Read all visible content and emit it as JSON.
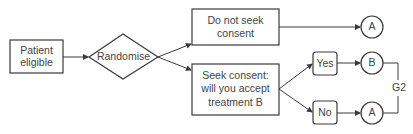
{
  "diagram": {
    "type": "flowchart",
    "nodes": {
      "patient": {
        "line1": "Patient",
        "line2": "eligible"
      },
      "randomise": {
        "label": "Randomise"
      },
      "no_consent": {
        "line1": "Do not seek",
        "line2": "consent"
      },
      "seek_consent": {
        "line1": "Seek consent:",
        "line2": "will you accept",
        "line3": "treatment B"
      },
      "yes": {
        "label": "Yes"
      },
      "no": {
        "label": "No"
      },
      "outcome_a_top": {
        "label": "A"
      },
      "outcome_b": {
        "label": "B"
      },
      "outcome_a_bottom": {
        "label": "A"
      },
      "group": {
        "label": "G2"
      }
    },
    "edges": [
      {
        "from": "patient",
        "to": "randomise"
      },
      {
        "from": "randomise",
        "to": "no_consent"
      },
      {
        "from": "randomise",
        "to": "seek_consent"
      },
      {
        "from": "no_consent",
        "to": "outcome_a_top"
      },
      {
        "from": "seek_consent",
        "to": "yes"
      },
      {
        "from": "seek_consent",
        "to": "no"
      },
      {
        "from": "yes",
        "to": "outcome_b"
      },
      {
        "from": "no",
        "to": "outcome_a_bottom"
      }
    ],
    "colors": {
      "stroke": "#3a3a3a",
      "text": "#444444",
      "background": "#ffffff"
    }
  }
}
